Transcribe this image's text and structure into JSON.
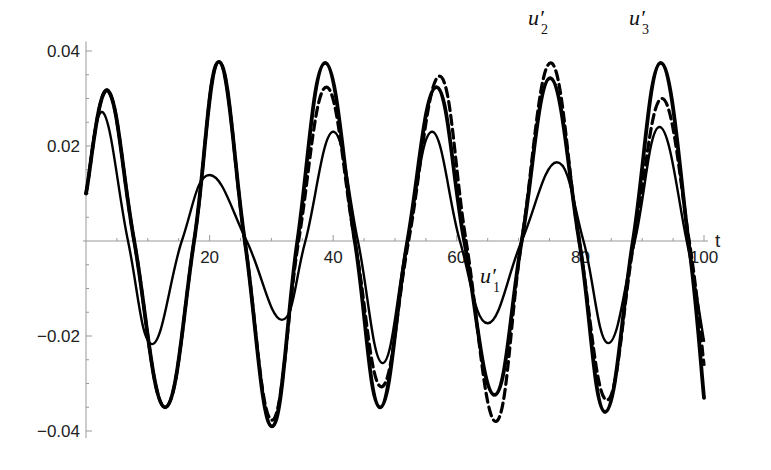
{
  "chart_data": {
    "type": "line",
    "title": "",
    "xlabel": "t",
    "ylabel": "",
    "xlim": [
      0,
      100
    ],
    "ylim": [
      -0.04,
      0.04
    ],
    "grid": false,
    "legend": "inline labels",
    "x_ticks": [
      20,
      40,
      60,
      80,
      100
    ],
    "x_tick_labels": [
      "20",
      "40",
      "60",
      "80",
      "100"
    ],
    "y_ticks": [
      -0.04,
      -0.02,
      0.02,
      0.04
    ],
    "y_tick_labels": [
      "-0.04",
      "-0.02",
      "0.02",
      "0.04"
    ],
    "series": [
      {
        "name": "u'1",
        "label_main": "u′",
        "label_sub": "1",
        "style": "thin-solid",
        "color": "#000000",
        "points": [
          [
            0,
            0.01
          ],
          [
            2.8,
            0.027
          ],
          [
            6.8,
            0
          ],
          [
            10.7,
            -0.0217
          ],
          [
            15.5,
            0
          ],
          [
            20,
            0.0139
          ],
          [
            26,
            0
          ],
          [
            31.7,
            -0.0166
          ],
          [
            35.5,
            0
          ],
          [
            40,
            0.023
          ],
          [
            44,
            0
          ],
          [
            48,
            -0.0257
          ],
          [
            52,
            0
          ],
          [
            56,
            0.023
          ],
          [
            60.5,
            0
          ],
          [
            65,
            -0.0173
          ],
          [
            70.5,
            0
          ],
          [
            76.2,
            0.0166
          ],
          [
            80.5,
            0
          ],
          [
            84.5,
            -0.0215
          ],
          [
            88.8,
            0
          ],
          [
            92.8,
            0.024
          ],
          [
            97.2,
            0
          ],
          [
            100,
            -0.021
          ]
        ]
      },
      {
        "name": "u'2",
        "label_main": "u′",
        "label_sub": "2",
        "style": "dashed",
        "color": "#000000",
        "points": [
          [
            0,
            0.01
          ],
          [
            3.6,
            0.0316
          ],
          [
            7.8,
            0
          ],
          [
            12.8,
            -0.035
          ],
          [
            17.5,
            0
          ],
          [
            21.5,
            0.0377
          ],
          [
            25.7,
            0
          ],
          [
            30.1,
            -0.0377
          ],
          [
            34.4,
            0
          ],
          [
            38.9,
            0.0324
          ],
          [
            43.5,
            0
          ],
          [
            47.8,
            -0.0307
          ],
          [
            52.2,
            0
          ],
          [
            57.2,
            0.0347
          ],
          [
            61.5,
            0
          ],
          [
            66.3,
            -0.038
          ],
          [
            70.5,
            0
          ],
          [
            75.2,
            0.0375
          ],
          [
            79.8,
            0
          ],
          [
            84.3,
            -0.0335
          ],
          [
            88.7,
            0
          ],
          [
            93.2,
            0.03
          ],
          [
            97.6,
            0
          ],
          [
            100,
            -0.026
          ]
        ]
      },
      {
        "name": "u'3",
        "label_main": "u′",
        "label_sub": "3",
        "style": "thick-solid",
        "color": "#000000",
        "points": [
          [
            0,
            0.01
          ],
          [
            3.6,
            0.0316
          ],
          [
            7.8,
            0
          ],
          [
            12.8,
            -0.035
          ],
          [
            17.5,
            0
          ],
          [
            21.5,
            0.0377
          ],
          [
            25.7,
            0
          ],
          [
            30.1,
            -0.039
          ],
          [
            34.2,
            0
          ],
          [
            38.7,
            0.0375
          ],
          [
            43.5,
            0
          ],
          [
            47.6,
            -0.035
          ],
          [
            52,
            0
          ],
          [
            56.7,
            0.0324
          ],
          [
            61.2,
            0
          ],
          [
            66.1,
            -0.0324
          ],
          [
            70.5,
            0
          ],
          [
            75.1,
            0.0343
          ],
          [
            79.8,
            0
          ],
          [
            84,
            -0.036
          ],
          [
            88.5,
            0
          ],
          [
            93,
            0.0375
          ],
          [
            97.5,
            0
          ],
          [
            100,
            -0.033
          ]
        ]
      }
    ],
    "annotations": [
      {
        "text": "u'1",
        "x": 66,
        "y": -0.007
      },
      {
        "text": "u'2",
        "x": 72.5,
        "y": 0.044
      },
      {
        "text": "u'3",
        "x": 89.5,
        "y": 0.044
      }
    ]
  },
  "axes": {
    "x_axis_label": "t"
  }
}
